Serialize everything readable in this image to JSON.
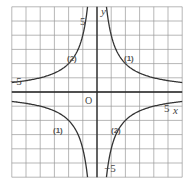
{
  "chart_data": {
    "type": "line",
    "title": "",
    "xlabel": "x",
    "ylabel": "y",
    "xlim": [
      -6,
      6
    ],
    "ylim": [
      -6,
      6
    ],
    "grid": true,
    "grid_step": 1,
    "origin_label": "O",
    "tick_labels": {
      "x_neg": "−5",
      "x_pos": "5",
      "y_pos": "5",
      "y_neg": "−5"
    },
    "series": [
      {
        "name": "(1)",
        "label": "⑴",
        "formula": "y = 4/x",
        "k": 4,
        "color": "#333333",
        "points": [
          [
            -6,
            -0.67
          ],
          [
            -4,
            -1
          ],
          [
            -2,
            -2
          ],
          [
            -1,
            -4
          ],
          [
            -0.67,
            -6
          ],
          [
            0.67,
            6
          ],
          [
            1,
            4
          ],
          [
            2,
            2
          ],
          [
            4,
            1
          ],
          [
            6,
            0.67
          ]
        ]
      },
      {
        "name": "(2)",
        "label": "⑵",
        "formula": "y = -4/x",
        "k": -4,
        "color": "#333333",
        "points": [
          [
            -6,
            0.67
          ],
          [
            -4,
            1
          ],
          [
            -2,
            2
          ],
          [
            -1,
            4
          ],
          [
            -0.67,
            6
          ],
          [
            0.67,
            -6
          ],
          [
            1,
            -4
          ],
          [
            2,
            -2
          ],
          [
            4,
            -1
          ],
          [
            6,
            -0.67
          ]
        ]
      }
    ],
    "curve_labels": [
      {
        "text": "(1)",
        "x": 1.9,
        "y": 2.5
      },
      {
        "text": "(2)",
        "x": -1.9,
        "y": 2.5
      },
      {
        "text": "(1)",
        "x": -2.1,
        "y": -2.5
      },
      {
        "text": "(2)",
        "x": 1.9,
        "y": -2.5
      }
    ]
  }
}
